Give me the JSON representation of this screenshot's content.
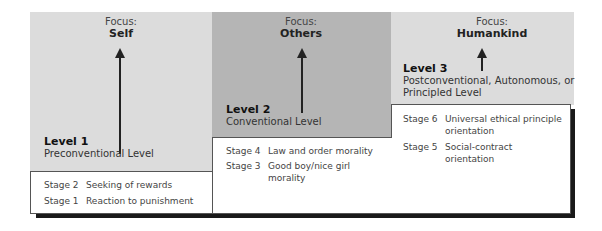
{
  "levels": [
    {
      "focus_label": "Focus:",
      "focus_value": "Self",
      "level_label": "Level 1",
      "level_name": "Preconventional Level",
      "panel_color": "#dcdcdc",
      "stages": [
        {
          "stage": "Stage 2",
          "description": "Seeking of rewards"
        },
        {
          "stage": "Stage 1",
          "description": "Reaction to punishment"
        }
      ]
    },
    {
      "focus_label": "Focus:",
      "focus_value": "Others",
      "level_label": "Level 2",
      "level_name": "Conventional Level",
      "panel_color": "#b5b5b5",
      "stages": [
        {
          "stage": "Stage 4",
          "description": "Law and order morality"
        },
        {
          "stage": "Stage 3",
          "description_line1": "Good boy/nice girl",
          "description_line2": "morality"
        }
      ]
    },
    {
      "focus_label": "Focus:",
      "focus_value": "Humankind",
      "level_label": "Level 3",
      "level_name_line1": "Postconventional, Autonomous, or",
      "level_name_line2": "Principled Level",
      "panel_color": "#dcdcdc",
      "stages": [
        {
          "stage": "Stage 6",
          "description_line1": "Universal ethical principle",
          "description_line2": "orientation"
        },
        {
          "stage": "Stage 5",
          "description_line1": "Social-contract",
          "description_line2": "orientation"
        }
      ]
    }
  ]
}
